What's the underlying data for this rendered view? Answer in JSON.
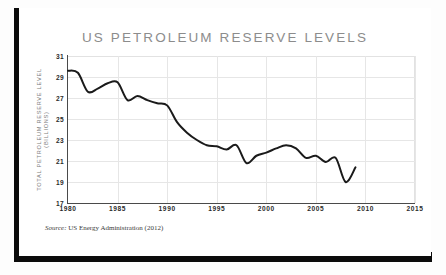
{
  "card": {
    "title": "US PETROLEUM RESERVE LEVELS",
    "source_prefix": "Source:",
    "source_text": "US Energy Administration (2012)",
    "frame_color": "#0b0b0b",
    "background": "#ffffff",
    "title_color": "#8c8c8c",
    "line_color": "#1a1a1a",
    "grid_color": "#e6e6e6",
    "axis_color": "#4a4a4a"
  },
  "chart_data": {
    "type": "line",
    "title": "US PETROLEUM RESERVE LEVELS",
    "xlabel": "",
    "ylabel": "TOTAL PETROLEUM RESERVE LEVEL (BILLIONS)",
    "ylabel_lines": [
      "TOTAL PETROLEUM RESERVE LEVEL",
      "(BILLIONS)"
    ],
    "xlim": [
      1980,
      2015
    ],
    "ylim": [
      17,
      31
    ],
    "grid": true,
    "legend": "none",
    "xticks": [
      1980,
      1985,
      1990,
      1995,
      2000,
      2005,
      2010,
      2015
    ],
    "yticks": [
      17,
      19,
      21,
      23,
      25,
      27,
      29,
      31
    ],
    "series": [
      {
        "name": "Total petroleum reserve level",
        "x": [
          1980,
          1981,
          1982,
          1983,
          1984,
          1985,
          1986,
          1987,
          1988,
          1989,
          1990,
          1991,
          1992,
          1993,
          1994,
          1995,
          1996,
          1997,
          1998,
          1999,
          2000,
          2001,
          2002,
          2003,
          2004,
          2005,
          2006,
          2007,
          2008,
          2009
        ],
        "values": [
          29.6,
          29.4,
          27.6,
          27.9,
          28.4,
          28.5,
          26.8,
          27.2,
          26.8,
          26.5,
          26.3,
          24.7,
          23.7,
          23.0,
          22.5,
          22.4,
          22.1,
          22.5,
          20.8,
          21.5,
          21.8,
          22.2,
          22.5,
          22.2,
          21.3,
          21.5,
          20.9,
          21.3,
          19.0,
          20.4
        ]
      }
    ]
  }
}
